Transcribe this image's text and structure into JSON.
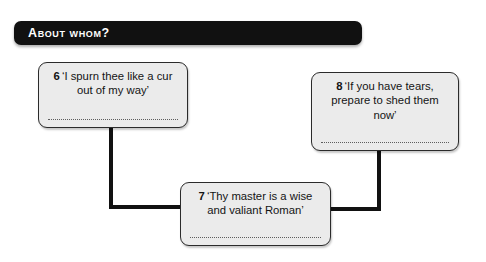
{
  "header": {
    "title": "About whom?"
  },
  "boxes": [
    {
      "number": "6",
      "quote": "‘I spurn thee like a cur out of my way’",
      "answer": ""
    },
    {
      "number": "8",
      "quote": "‘If you have tears, prepare to shed them now’",
      "answer": ""
    },
    {
      "number": "7",
      "quote": "‘Thy master is a wise and valiant Roman’",
      "answer": ""
    }
  ],
  "colors": {
    "banner_background": "#111111",
    "banner_text": "#ffffff",
    "box_fill": "#ebebeb",
    "box_border": "#2b2b2b",
    "connector": "#111111",
    "page_background": "#ffffff"
  }
}
